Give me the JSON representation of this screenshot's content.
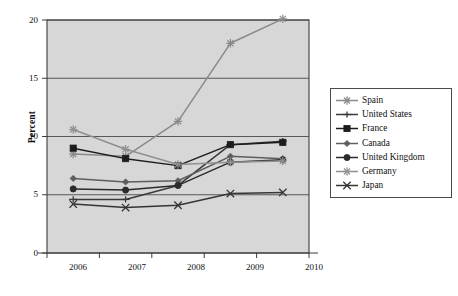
{
  "chart_data": {
    "type": "line",
    "title": "",
    "subtitle": "",
    "xlabel": "",
    "ylabel": "Percent",
    "categories": [
      "2006",
      "2007",
      "2008",
      "2009",
      "2010"
    ],
    "x": [
      2006,
      2007,
      2008,
      2009,
      2010
    ],
    "xlim": [
      2005.6,
      2010.4
    ],
    "ylim": [
      0,
      20
    ],
    "yticks": [
      0,
      5,
      10,
      15,
      20
    ],
    "ytick_labels": [
      "0",
      "5",
      "10",
      "15",
      "20"
    ],
    "xticks": [
      2006,
      2007,
      2008,
      2009,
      2010
    ],
    "xtick_labels": [
      "2006",
      "2007",
      "2008",
      "2009",
      "2010"
    ],
    "grid": "horizontal",
    "legend_position": "right-outside",
    "plot_background": "#d7d7d7",
    "series": [
      {
        "name": "Spain",
        "marker": "asterisk",
        "color": "#8a8a8a",
        "values": [
          8.5,
          8.3,
          11.3,
          18.0,
          20.1
        ]
      },
      {
        "name": "United States",
        "marker": "plus",
        "color": "#3a3a3a",
        "values": [
          4.6,
          4.6,
          5.8,
          9.3,
          9.6
        ]
      },
      {
        "name": "France",
        "marker": "square",
        "color": "#1c1c1c",
        "values": [
          9.0,
          8.1,
          7.5,
          9.3,
          9.5
        ]
      },
      {
        "name": "Canada",
        "marker": "diamond",
        "color": "#5e5e5e",
        "values": [
          6.4,
          6.1,
          6.2,
          8.3,
          8.1
        ]
      },
      {
        "name": "United Kingdom",
        "marker": "circle",
        "color": "#2b2b2b",
        "values": [
          5.5,
          5.4,
          5.8,
          7.8,
          8.0
        ]
      },
      {
        "name": "Germany",
        "marker": "star",
        "color": "#909090",
        "values": [
          10.6,
          8.9,
          7.6,
          7.8,
          7.9
        ]
      },
      {
        "name": "Japan",
        "marker": "cross",
        "color": "#353535",
        "values": [
          4.2,
          3.9,
          4.1,
          5.1,
          5.2
        ]
      }
    ]
  },
  "axes": {
    "y_title": "Percent",
    "y_ticks": [
      "20",
      "15",
      "10",
      "5",
      "0"
    ],
    "x_ticks": [
      "2006",
      "2007",
      "2008",
      "2009",
      "2010"
    ]
  },
  "legend": {
    "items": [
      {
        "label": "Spain"
      },
      {
        "label": "United States"
      },
      {
        "label": "France"
      },
      {
        "label": "Canada"
      },
      {
        "label": "United Kingdom"
      },
      {
        "label": "Germany"
      },
      {
        "label": "Japan"
      }
    ]
  }
}
